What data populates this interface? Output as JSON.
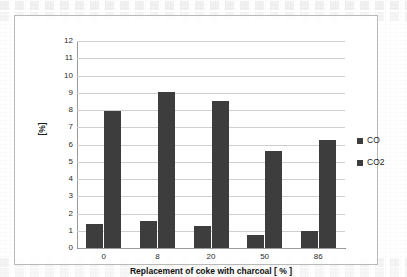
{
  "chart_data": {
    "type": "bar",
    "title": "",
    "xlabel": "Replacement of coke with charcoal [ % ]",
    "ylabel": "[%]",
    "categories": [
      "0",
      "8",
      "20",
      "50",
      "86"
    ],
    "series": [
      {
        "name": "CO",
        "values": [
          1.4,
          1.55,
          1.3,
          0.75,
          1.0
        ],
        "color": "#3d3d3d"
      },
      {
        "name": "CO2",
        "values": [
          7.95,
          9.05,
          8.5,
          5.65,
          6.25
        ],
        "color": "#3d3d3d"
      }
    ],
    "ylim": [
      0,
      12
    ],
    "ytick_labels": [
      "12",
      "11",
      "10",
      "9",
      "8",
      "7",
      "6",
      "5",
      "4",
      "3",
      "2",
      "1",
      "0"
    ],
    "ytick_values": [
      12,
      11,
      10,
      9,
      8,
      7,
      6,
      5,
      4,
      3,
      2,
      1,
      0
    ],
    "grid": true,
    "grid_axis": "y",
    "legend_position": "right",
    "legend_entries": [
      "CO",
      "CO2"
    ],
    "plot_background": "#ffffff",
    "grid_color": "#cfcfcf",
    "axis_color": "#9a9a9a",
    "frame_color": "#b9b9b9"
  }
}
